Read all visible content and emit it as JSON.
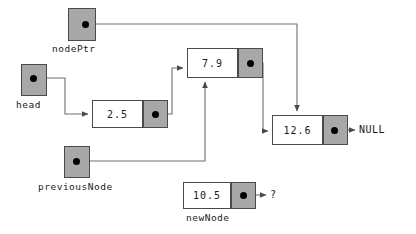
{
  "diagram": {
    "colors": {
      "node_fill": "#ffffff",
      "pointer_fill": "#a8a8a8",
      "border": "#4a4a4a",
      "line": "#6e6e6e",
      "dot": "#000000",
      "text": "#1a1a1a",
      "background": "#ffffff"
    },
    "pointer_variables": [
      {
        "id": "nodePtr",
        "label": "nodePtr",
        "x": 68,
        "y": 8,
        "w": 28,
        "h": 33,
        "dot_x": 85,
        "dot_y": 24,
        "label_x": 52,
        "label_y": 43
      },
      {
        "id": "head",
        "label": "head",
        "x": 21,
        "y": 64,
        "w": 26,
        "h": 32,
        "dot_x": 33,
        "dot_y": 78,
        "label_x": 16,
        "label_y": 99
      },
      {
        "id": "previousNode",
        "label": "previousNode",
        "x": 64,
        "y": 146,
        "w": 26,
        "h": 32,
        "dot_x": 76,
        "dot_y": 161,
        "label_x": 38,
        "label_y": 181
      }
    ],
    "nodes": [
      {
        "id": "node-2-5",
        "value": "2.5",
        "x": 92,
        "y": 100,
        "w": 76,
        "h": 28,
        "data_w": 51,
        "ptr_w": 25,
        "dot_x": 155,
        "dot_y": 114,
        "label": "",
        "label_x": 0,
        "label_y": 0
      },
      {
        "id": "node-7-9",
        "value": "7.9",
        "x": 187,
        "y": 48,
        "w": 76,
        "h": 30,
        "data_w": 51,
        "ptr_w": 25,
        "dot_x": 250,
        "dot_y": 63,
        "label": "",
        "label_x": 0,
        "label_y": 0
      },
      {
        "id": "node-12-6",
        "value": "12.6",
        "x": 272,
        "y": 115,
        "w": 76,
        "h": 30,
        "data_w": 51,
        "ptr_w": 25,
        "dot_x": 334,
        "dot_y": 130,
        "label": "",
        "label_x": 0,
        "label_y": 0
      },
      {
        "id": "node-10-5",
        "value": "10.5",
        "x": 183,
        "y": 182,
        "w": 73,
        "h": 27,
        "data_w": 48,
        "ptr_w": 25,
        "dot_x": 243,
        "dot_y": 195,
        "label": "newNode",
        "label_x": 186,
        "label_y": 212
      }
    ],
    "terminals": [
      {
        "id": "null-terminal",
        "text": "NULL",
        "x": 359,
        "y": 124
      },
      {
        "id": "unknown-terminal",
        "text": "?",
        "x": 270,
        "y": 189
      }
    ],
    "connections": [
      {
        "id": "head-to-2-5",
        "from": "head",
        "to": "node-2-5",
        "path": "M33,78 L65,78 L65,114 L88,114",
        "arrow": "right"
      },
      {
        "id": "nodePtr-to-12-6",
        "from": "nodePtr",
        "to": "node-12-6",
        "path": "M85,24 L297,24 L297,111",
        "arrow": "down"
      },
      {
        "id": "previousNode-to-7-9",
        "from": "previousNode",
        "to": "node-7-9",
        "path": "M76,161 L205,161 L205,82",
        "arrow": "up"
      },
      {
        "id": "node-2-5-to-7-9",
        "from": "node-2-5",
        "to": "node-7-9",
        "path": "M155,114 L172,114 L172,68 L183,68",
        "arrow": "right"
      },
      {
        "id": "node-7-9-to-12-6",
        "from": "node-7-9",
        "to": "node-12-6",
        "path": "M250,63 L263,63 L263,131 L268,131",
        "arrow": "right"
      },
      {
        "id": "node-12-6-to-null",
        "from": "node-12-6",
        "to": "NULL",
        "path": "M334,130 L355,130",
        "arrow": "right"
      },
      {
        "id": "node-10-5-to-unknown",
        "from": "node-10-5",
        "to": "?",
        "path": "M243,195 L266,195",
        "arrow": "right"
      }
    ]
  }
}
